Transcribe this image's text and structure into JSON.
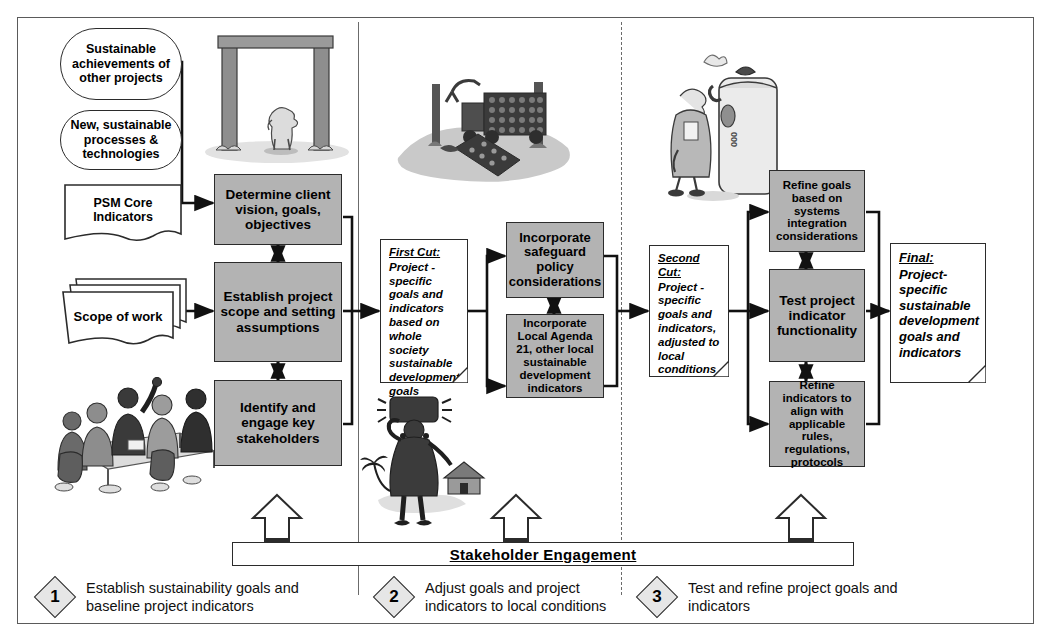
{
  "diagram": {
    "colors": {
      "process_fill": "#b3b3b3",
      "note_fill": "#ffffff",
      "line": "#1a1a1a",
      "frame": "#5a5a5a",
      "diamond_fill": "#e6e6e6"
    },
    "inputs": [
      {
        "name": "sustainable-achievements",
        "shape": "rounded",
        "text": "Sustainable achievements of other projects"
      },
      {
        "name": "new-processes",
        "shape": "rounded",
        "text": "New, sustainable processes & technologies"
      },
      {
        "name": "psm-core-indicators",
        "shape": "document",
        "text": "PSM Core Indicators"
      },
      {
        "name": "scope-of-work",
        "shape": "stacked-document",
        "text": "Scope of work"
      }
    ],
    "stage1": {
      "boxes": [
        {
          "name": "determine-client-vision",
          "text": "Determine client vision, goals, objectives"
        },
        {
          "name": "establish-project-scope",
          "text": "Establish project scope and setting assumptions"
        },
        {
          "name": "identify-stakeholders",
          "text": "Identify and engage key stakeholders"
        }
      ]
    },
    "stage2": {
      "note": {
        "name": "first-cut-note",
        "heading": "First Cut:",
        "body": "Project - specific goals and indicators based on whole society sustainable development goals"
      },
      "boxes": [
        {
          "name": "incorporate-safeguard-policy",
          "text": "Incorporate safeguard policy considerations"
        },
        {
          "name": "incorporate-local-agenda-21",
          "text": "Incorporate Local Agenda 21, other local sustainable development indicators"
        }
      ]
    },
    "stage3": {
      "note": {
        "name": "second-cut-note",
        "heading": "Second Cut:",
        "body": "Project - specific goals and indicators, adjusted to local conditions"
      },
      "boxes": [
        {
          "name": "refine-goals-systems-integration",
          "text": "Refine goals based on systems integration considerations"
        },
        {
          "name": "test-project-indicator-functionality",
          "text": "Test project indicator functionality"
        },
        {
          "name": "refine-indicators-rules",
          "text": "Refine indicators to align with applicable rules, regulations, protocols"
        }
      ]
    },
    "output": {
      "name": "final-note",
      "heading": "Final:",
      "body": "Project-specific sustainable development goals and indicators"
    },
    "engagement_band": {
      "name": "stakeholder-engagement-band",
      "text": "Stakeholder Engagement"
    },
    "legend": [
      {
        "number": "1",
        "text": "Establish sustainability goals and baseline project indicators"
      },
      {
        "number": "2",
        "text": "Adjust goals and project indicators to local conditions"
      },
      {
        "number": "3",
        "text": "Test and refine project goals and indicators"
      }
    ],
    "illustrations": [
      {
        "name": "timber-frame-with-person-illustration",
        "caption": ""
      },
      {
        "name": "logging-truck-illustration",
        "caption": ""
      },
      {
        "name": "inspector-with-tank-illustration",
        "caption": ""
      },
      {
        "name": "stakeholder-meeting-illustration",
        "caption": ""
      },
      {
        "name": "woman-carrying-load-illustration",
        "caption": ""
      }
    ]
  }
}
